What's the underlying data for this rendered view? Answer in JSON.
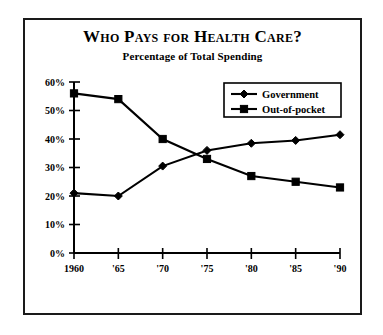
{
  "figure": {
    "title": "Who Pays for Health Care?",
    "subtitle": "Percentage of Total Spending",
    "border_color": "#1a1a1a",
    "background": "#ffffff"
  },
  "chart_data": {
    "type": "line",
    "title": "Who Pays for Health Care?",
    "subtitle": "Percentage of Total Spending",
    "xlabel": "",
    "ylabel": "",
    "categories": [
      "1960",
      "'65",
      "'70",
      "'75",
      "'80",
      "'85",
      "'90"
    ],
    "x_tick_labels": [
      "1960",
      "'65",
      "'70",
      "'75",
      "'80",
      "'85",
      "'90"
    ],
    "y_tick_labels": [
      "0%",
      "10%",
      "20%",
      "30%",
      "40%",
      "50%",
      "60%"
    ],
    "y_tick_values": [
      0,
      10,
      20,
      30,
      40,
      50,
      60
    ],
    "ylim": [
      0,
      60
    ],
    "grid": false,
    "legend_position": "top-right",
    "series": [
      {
        "name": "Government",
        "marker": "diamond",
        "color": "#000000",
        "values": [
          21,
          20,
          30.5,
          36,
          38.5,
          39.5,
          41.5
        ]
      },
      {
        "name": "Out-of-pocket",
        "marker": "square",
        "color": "#000000",
        "values": [
          56,
          54,
          40,
          33,
          27,
          25,
          23
        ]
      }
    ]
  },
  "legend": {
    "items": [
      {
        "label": "Government",
        "marker": "diamond"
      },
      {
        "label": "Out-of-pocket",
        "marker": "square"
      }
    ]
  }
}
